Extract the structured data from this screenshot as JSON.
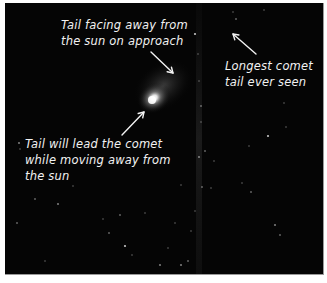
{
  "image": {
    "description": "Night-sky photograph of a comet with hand-written annotations",
    "background_color": "#050505",
    "border_color": "#ffffff",
    "comet": {
      "nucleus": {
        "x": 147,
        "y": 97,
        "color": "#ffffff"
      },
      "coma_color": "#bfbfbf"
    },
    "tail_streak": {
      "x": 194,
      "color": "#2a2a2a"
    }
  },
  "annotations": [
    {
      "id": "approach-tail",
      "lines": [
        "Tail facing away from",
        "the sun on approach"
      ],
      "arrow": {
        "from": [
          146,
          49
        ],
        "to": [
          168,
          70
        ]
      }
    },
    {
      "id": "longest-tail",
      "lines": [
        "Longest comet",
        "tail ever seen"
      ],
      "arrow": {
        "from": [
          251,
          51
        ],
        "to": [
          228,
          31
        ]
      }
    },
    {
      "id": "lead-tail",
      "lines": [
        "Tail will lead the comet",
        "while moving away from",
        "the sun"
      ],
      "arrow": {
        "from": [
          117,
          132
        ],
        "to": [
          139,
          109
        ]
      }
    }
  ],
  "stars": [
    [
      190,
      31
    ],
    [
      193,
      51
    ],
    [
      194,
      78
    ],
    [
      196,
      103
    ],
    [
      196,
      119
    ],
    [
      194,
      154
    ],
    [
      197,
      184
    ],
    [
      190,
      208
    ],
    [
      186,
      228
    ],
    [
      183,
      258
    ],
    [
      176,
      262
    ],
    [
      228,
      9
    ],
    [
      231,
      16
    ],
    [
      259,
      7
    ],
    [
      279,
      100
    ],
    [
      263,
      133
    ],
    [
      244,
      143
    ],
    [
      237,
      180
    ],
    [
      246,
      189
    ],
    [
      281,
      124
    ],
    [
      270,
      222
    ],
    [
      275,
      232
    ],
    [
      209,
      158
    ],
    [
      206,
      185
    ],
    [
      200,
      148
    ],
    [
      14,
      140
    ],
    [
      15,
      146
    ],
    [
      30,
      196
    ],
    [
      127,
      252
    ],
    [
      98,
      216
    ],
    [
      120,
      243
    ],
    [
      140,
      210
    ],
    [
      163,
      245
    ],
    [
      104,
      230
    ],
    [
      68,
      183
    ],
    [
      53,
      201
    ],
    [
      12,
      220
    ],
    [
      170,
      220
    ],
    [
      176,
      182
    ],
    [
      115,
      212
    ],
    [
      155,
      262
    ],
    [
      40,
      258
    ]
  ]
}
